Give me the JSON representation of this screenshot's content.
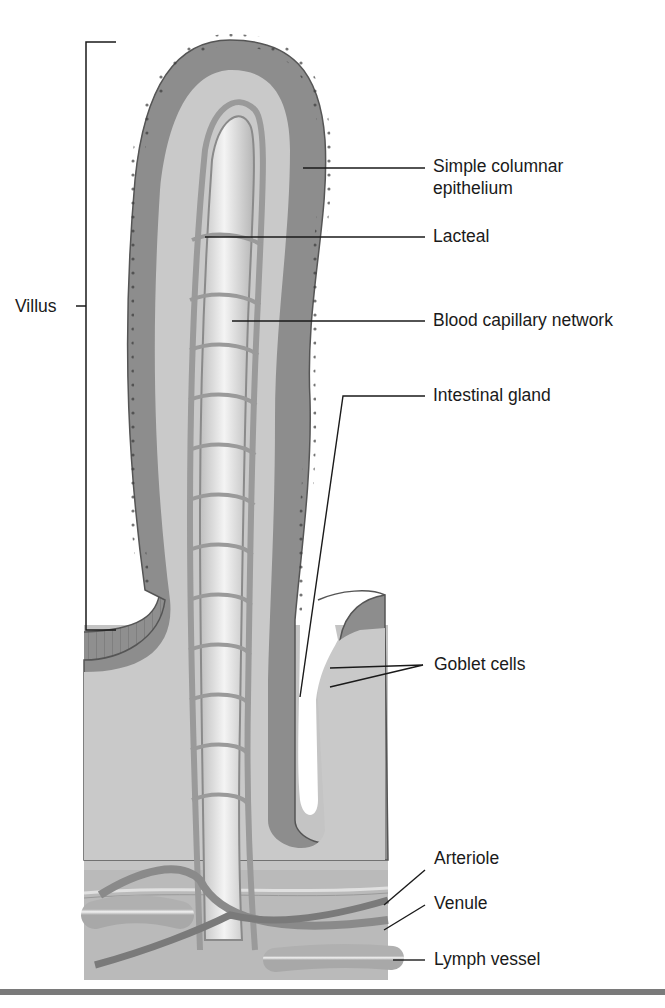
{
  "figure": {
    "labels": {
      "simple_columnar_epithelium": "Simple columnar\nepithelium",
      "simple_columnar_line1": "Simple columnar",
      "simple_columnar_line2": "epithelium",
      "lacteal": "Lacteal",
      "blood_capillary_network": "Blood capillary network",
      "intestinal_gland": "Intestinal gland",
      "goblet_cells": "Goblet cells",
      "arteriole": "Arteriole",
      "venule": "Venule",
      "lymph_vessel": "Lymph vessel",
      "villus": "Villus"
    },
    "colors": {
      "epithelium": "#8a8a8a",
      "lamina_propria": "#c8c8c8",
      "capillary": "#9a9a9a",
      "lacteal": "#e6e6e6",
      "submucosa": "#bdbdbd",
      "line": "#1a1a1a",
      "rule": "#7a7a7a"
    }
  }
}
